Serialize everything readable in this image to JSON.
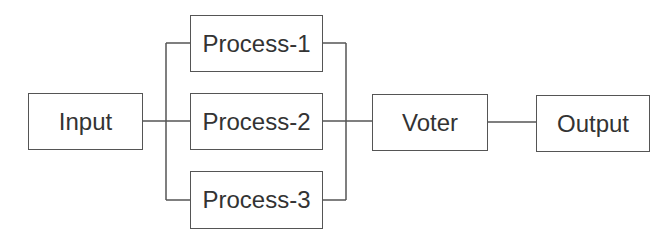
{
  "diagram": {
    "type": "block-diagram",
    "nodes": {
      "input": {
        "label": "Input"
      },
      "process1": {
        "label": "Process-1"
      },
      "process2": {
        "label": "Process-2"
      },
      "process3": {
        "label": "Process-3"
      },
      "voter": {
        "label": "Voter"
      },
      "output": {
        "label": "Output"
      }
    },
    "edges": [
      {
        "from": "Input",
        "to": "Process-1"
      },
      {
        "from": "Input",
        "to": "Process-2"
      },
      {
        "from": "Input",
        "to": "Process-3"
      },
      {
        "from": "Process-1",
        "to": "Voter"
      },
      {
        "from": "Process-2",
        "to": "Voter"
      },
      {
        "from": "Process-3",
        "to": "Voter"
      },
      {
        "from": "Voter",
        "to": "Output"
      }
    ],
    "colors": {
      "stroke": "#555555",
      "text": "#333333",
      "background": "#ffffff"
    }
  }
}
